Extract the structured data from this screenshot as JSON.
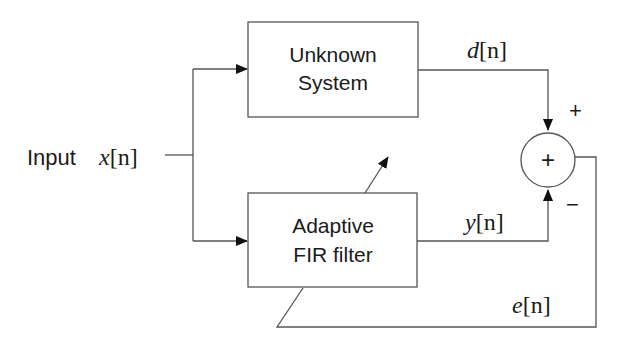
{
  "diagram": {
    "input": {
      "label": "Input",
      "signal_var": "x",
      "signal_idx": "[n]"
    },
    "blocks": [
      {
        "id": "unknown",
        "line1": "Unknown",
        "line2": "System"
      },
      {
        "id": "adaptive",
        "line1": "Adaptive",
        "line2": "FIR filter"
      }
    ],
    "summer": {
      "symbol": "+",
      "plus_sign": "+",
      "minus_sign": "−"
    },
    "signals": {
      "d": {
        "var": "d",
        "idx": "[n]"
      },
      "y": {
        "var": "y",
        "idx": "[n]"
      },
      "e": {
        "var": "e",
        "idx": "[n]"
      }
    },
    "colors": {
      "line": "#555555",
      "text": "#1a1a1a",
      "arrow": "#111111"
    }
  }
}
